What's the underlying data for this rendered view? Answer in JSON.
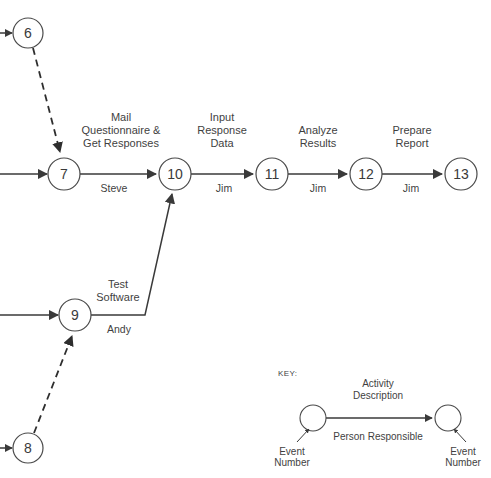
{
  "diagram": {
    "type": "activity-on-arrow-network",
    "colors": {
      "background": "#ffffff",
      "stroke": "#3a3a3a",
      "node_stroke": "#4a4a4a",
      "text": "#3f3f3f"
    },
    "nodes": [
      {
        "id": "node-6",
        "label": "6",
        "cx": 28,
        "cy": 33,
        "r": 15
      },
      {
        "id": "node-7",
        "label": "7",
        "cx": 64,
        "cy": 174,
        "r": 16
      },
      {
        "id": "node-8",
        "label": "8",
        "cx": 28,
        "cy": 448,
        "r": 15
      },
      {
        "id": "node-9",
        "label": "9",
        "cx": 75,
        "cy": 315,
        "r": 16
      },
      {
        "id": "node-10",
        "label": "10",
        "cx": 175,
        "cy": 174,
        "r": 16
      },
      {
        "id": "node-11",
        "label": "11",
        "cx": 272,
        "cy": 174,
        "r": 16
      },
      {
        "id": "node-12",
        "label": "12",
        "cx": 366,
        "cy": 174,
        "r": 16
      },
      {
        "id": "node-13",
        "label": "13",
        "cx": 461,
        "cy": 174,
        "r": 16
      }
    ],
    "activities": [
      {
        "id": "activity-7-10",
        "from": "7",
        "to": "10",
        "description": [
          "Mail",
          "Questionnaire  &",
          "Get Responses"
        ],
        "person": "Steve"
      },
      {
        "id": "activity-10-11",
        "from": "10",
        "to": "11",
        "description": [
          "Input",
          "Response",
          "Data"
        ],
        "person": "Jim"
      },
      {
        "id": "activity-11-12",
        "from": "11",
        "to": "12",
        "description": [
          "Analyze",
          "Results"
        ],
        "person": "Jim"
      },
      {
        "id": "activity-12-13",
        "from": "12",
        "to": "13",
        "description": [
          "Prepare",
          "Report"
        ],
        "person": "Jim"
      },
      {
        "id": "activity-9-10",
        "from": "9",
        "to": "10",
        "description": [
          "Test",
          "Software"
        ],
        "person": "Andy"
      }
    ],
    "dummy_activities": [
      {
        "id": "dummy-6-7",
        "from": "6",
        "to": "7",
        "style": "dashed"
      },
      {
        "id": "dummy-8-9",
        "from": "8",
        "to": "9",
        "style": "dashed"
      }
    ],
    "labels": {
      "mail_line1": "Mail",
      "mail_line2": "Questionnaire  &",
      "mail_line3": "Get Responses",
      "steve": "Steve",
      "input_line1": "Input",
      "input_line2": "Response",
      "input_line3": "Data",
      "jim_1": "Jim",
      "analyze_line1": "Analyze",
      "analyze_line2": "Results",
      "jim_2": "Jim",
      "prepare_line1": "Prepare",
      "prepare_line2": "Report",
      "jim_3": "Jim",
      "test_line1": "Test",
      "test_line2": "Software",
      "andy": "Andy"
    },
    "key": {
      "title": "KEY:",
      "activity_line1": "Activity",
      "activity_line2": "Description",
      "person_responsible": "Person Responsible",
      "event_left_line1": "Event",
      "event_left_line2": "Number",
      "event_right_line1": "Event",
      "event_right_line2": "Number"
    }
  }
}
